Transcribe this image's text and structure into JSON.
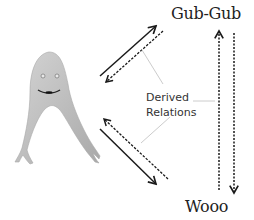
{
  "diagram": {
    "type": "relational-frame",
    "nodes": {
      "top_right": "Gub-Gub",
      "bottom_right": "Wooo",
      "left": "creature-image"
    },
    "annotation": {
      "line1": "Derived",
      "line2": "Relations"
    },
    "edges": [
      {
        "from": "creature-image",
        "to": "Gub-Gub",
        "style": "solid",
        "kind": "trained"
      },
      {
        "from": "Gub-Gub",
        "to": "creature-image",
        "style": "dashed",
        "kind": "derived"
      },
      {
        "from": "Wooo",
        "to": "creature-image",
        "style": "dashed",
        "kind": "derived"
      },
      {
        "from": "creature-image",
        "to": "Wooo",
        "style": "solid",
        "kind": "trained"
      },
      {
        "from": "Wooo",
        "to": "Gub-Gub",
        "style": "dashed",
        "kind": "derived"
      },
      {
        "from": "Gub-Gub",
        "to": "Wooo",
        "style": "dashed",
        "kind": "derived"
      }
    ],
    "colors": {
      "creature_fill": "#bdbdbd",
      "creature_edge": "#a8a8a8",
      "arrow": "#1a1a1a",
      "connector": "#cccccc",
      "text": "#222222"
    }
  }
}
